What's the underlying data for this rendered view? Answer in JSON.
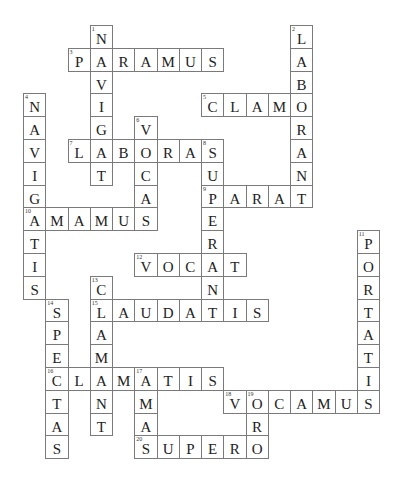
{
  "puzzle": {
    "type": "crossword",
    "grid": {
      "cols": 16,
      "rows": 19,
      "origin_x": 23,
      "origin_y": 25,
      "col_pitch": 22.25,
      "row_pitch": 22.8
    },
    "colors": {
      "border": "#7a7a7a",
      "letter": "#222222",
      "background": "#ffffff"
    },
    "words": [
      {
        "number": 1,
        "direction": "down",
        "answer": "NAVIGAT",
        "row": 0,
        "col": 3
      },
      {
        "number": 2,
        "direction": "down",
        "answer": "LABORANT",
        "row": 0,
        "col": 12
      },
      {
        "number": 3,
        "direction": "across",
        "answer": "PARAMUS",
        "row": 1,
        "col": 2
      },
      {
        "number": 4,
        "direction": "down",
        "answer": "NAVIGATIS",
        "row": 3,
        "col": 0
      },
      {
        "number": 5,
        "direction": "across",
        "answer": "CLAMO",
        "row": 3,
        "col": 8
      },
      {
        "number": 6,
        "direction": "down",
        "answer": "VOCAS",
        "row": 4,
        "col": 5
      },
      {
        "number": 7,
        "direction": "across",
        "answer": "LABORAS",
        "row": 5,
        "col": 2
      },
      {
        "number": 8,
        "direction": "down",
        "answer": "SUPERANT",
        "row": 5,
        "col": 8
      },
      {
        "number": 9,
        "direction": "across",
        "answer": "PARAT",
        "row": 7,
        "col": 8
      },
      {
        "number": 10,
        "direction": "across",
        "answer": "AMAMUS",
        "row": 8,
        "col": 0
      },
      {
        "number": 11,
        "direction": "down",
        "answer": "PORTATIS",
        "row": 9,
        "col": 15
      },
      {
        "number": 12,
        "direction": "across",
        "answer": "VOCAT",
        "row": 10,
        "col": 5
      },
      {
        "number": 13,
        "direction": "down",
        "answer": "CLAMANT",
        "row": 11,
        "col": 3
      },
      {
        "number": 14,
        "direction": "down",
        "answer": "SPECTAS",
        "row": 12,
        "col": 1
      },
      {
        "number": 15,
        "direction": "across",
        "answer": "LAUDATIS",
        "row": 12,
        "col": 3
      },
      {
        "number": 16,
        "direction": "across",
        "answer": "CLAMATIS",
        "row": 15,
        "col": 1
      },
      {
        "number": 17,
        "direction": "down",
        "answer": "AMAS",
        "row": 15,
        "col": 5
      },
      {
        "number": 18,
        "direction": "across",
        "answer": "VOCAMUS",
        "row": 16,
        "col": 9
      },
      {
        "number": 19,
        "direction": "down",
        "answer": "ORO",
        "row": 16,
        "col": 10
      },
      {
        "number": 20,
        "direction": "across",
        "answer": "SUPERO",
        "row": 18,
        "col": 5
      }
    ]
  }
}
